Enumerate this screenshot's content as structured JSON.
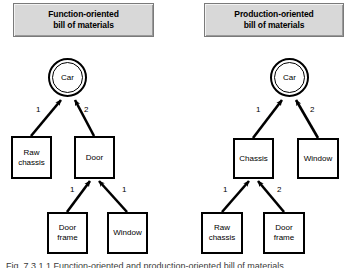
{
  "figure": {
    "caption": "Fig. 7.3.1.1  Function-oriented and production-oriented bill of materials"
  },
  "panels": [
    {
      "id": "function-oriented",
      "title_line1": "Function-oriented",
      "title_line2": "bill of materials",
      "root": {
        "label": "Car"
      },
      "level1": [
        {
          "label": "Raw\nchassis",
          "label_line1": "Raw",
          "label_line2": "chassis",
          "quantity": "1"
        },
        {
          "label": "Door",
          "label_line1": "Door",
          "label_line2": "",
          "quantity": "2"
        }
      ],
      "level2_parent": "Door",
      "level2": [
        {
          "label_line1": "Door",
          "label_line2": "frame",
          "quantity": "1"
        },
        {
          "label_line1": "Window",
          "label_line2": "",
          "quantity": "1"
        }
      ]
    },
    {
      "id": "production-oriented",
      "title_line1": "Production-oriented",
      "title_line2": "bill of materials",
      "root": {
        "label": "Car"
      },
      "level1": [
        {
          "label_line1": "Chassis",
          "label_line2": "",
          "quantity": "1"
        },
        {
          "label_line1": "Window",
          "label_line2": "",
          "quantity": "2"
        }
      ],
      "level2_parent": "Chassis",
      "level2": [
        {
          "label_line1": "Raw",
          "label_line2": "chassis",
          "quantity": "1"
        },
        {
          "label_line1": "Door",
          "label_line2": "frame",
          "quantity": "2"
        }
      ]
    }
  ],
  "colors": {
    "banner_fill": "#d8d8d8",
    "banner_border": "#7a7a7a",
    "node_border": "#000000",
    "node_fill": "#ffffff",
    "edge": "#000000",
    "text": "#000000"
  }
}
